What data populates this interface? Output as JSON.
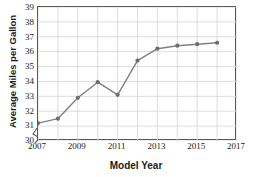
{
  "chart_data": {
    "type": "line",
    "title": "",
    "xlabel": "Model Year",
    "ylabel": "Average Miles per Gallon",
    "x": [
      2007,
      2008,
      2009,
      2010,
      2011,
      2012,
      2013,
      2014,
      2015,
      2016
    ],
    "values": [
      31.2,
      31.5,
      32.9,
      33.95,
      33.1,
      35.4,
      36.2,
      36.4,
      36.5,
      36.6
    ],
    "series": [
      {
        "name": "Average Miles per Gallon",
        "values": [
          31.2,
          31.5,
          32.9,
          33.95,
          33.1,
          35.4,
          36.2,
          36.4,
          36.5,
          36.6
        ]
      }
    ],
    "xlim": [
      2007,
      2017
    ],
    "ylim": [
      30,
      39
    ],
    "y_tick_labels": [
      "39",
      "38",
      "37",
      "36",
      "35",
      "34",
      "33",
      "32",
      "31",
      "30"
    ],
    "x_tick_labels": [
      "2007",
      "2009",
      "2011",
      "2013",
      "2015",
      "2017"
    ],
    "x_tick_values": [
      2007,
      2009,
      2011,
      2013,
      2015,
      2017
    ],
    "x_gridline_values": [
      2007,
      2008,
      2009,
      2010,
      2011,
      2012,
      2013,
      2014,
      2015,
      2016,
      2017
    ],
    "grid": true,
    "legend": "none",
    "axis_break": "y-axis break below 30",
    "line_color": "#808080",
    "marker_color": "#6e6e6e",
    "grid_color": "#d9d9d9",
    "frame_color": "#595959",
    "background_color": "#ffffff"
  }
}
